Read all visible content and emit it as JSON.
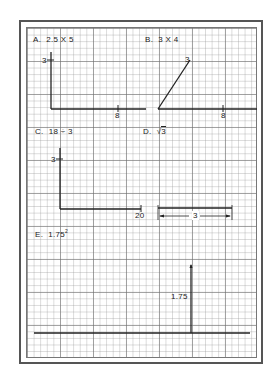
{
  "problems": {
    "a": {
      "label": "A.",
      "expr": "2.5 X 5",
      "y_tick": "3",
      "x_tick": "8"
    },
    "b": {
      "label": "B.",
      "expr": "3 X 4",
      "point_label": "3",
      "x_tick": "8"
    },
    "c": {
      "label": "C.",
      "expr": "18 ÷ 3",
      "y_tick": "3",
      "x_tick": "20"
    },
    "d": {
      "label": "D.",
      "expr_root": "√",
      "expr_value": "3",
      "dimension": "3"
    },
    "e": {
      "label": "E.",
      "expr_base": "1.75",
      "expr_exp": "2",
      "height_label": "1.75"
    }
  },
  "colors": {
    "line": "#222222",
    "grid_major": "#6e6e6e",
    "grid_minor": "#969696",
    "border": "#555555"
  }
}
